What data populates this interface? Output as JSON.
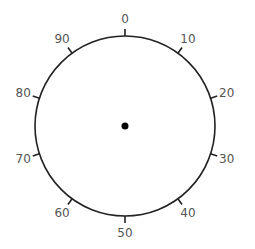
{
  "dial": {
    "center": [
      125,
      126
    ],
    "radius": 90,
    "stroke_color": "#222222",
    "label_color": "#555555",
    "tick_length": 7,
    "label_offset": 17,
    "ticks": [
      {
        "label": "0",
        "angle": 0
      },
      {
        "label": "10",
        "angle": 36
      },
      {
        "label": "20",
        "angle": 72
      },
      {
        "label": "30",
        "angle": 108
      },
      {
        "label": "40",
        "angle": 144
      },
      {
        "label": "50",
        "angle": 180
      },
      {
        "label": "60",
        "angle": 216
      },
      {
        "label": "70",
        "angle": 252
      },
      {
        "label": "80",
        "angle": 288
      },
      {
        "label": "90",
        "angle": 324
      }
    ],
    "center_dot_radius": 3.5
  }
}
